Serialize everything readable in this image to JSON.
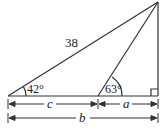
{
  "diagram": {
    "hypotenuse_label": "38",
    "angle_left": "42°",
    "angle_inner": "63°",
    "dim_c": "c",
    "dim_a": "a",
    "dim_b": "b",
    "right_angle_marker": "right-angle"
  }
}
